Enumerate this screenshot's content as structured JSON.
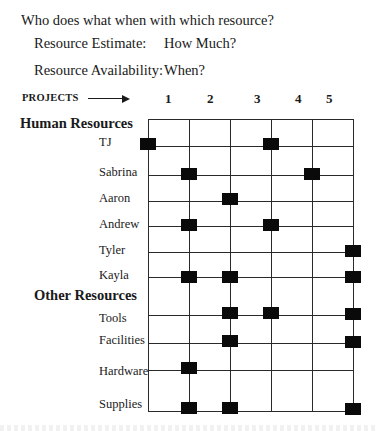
{
  "title": "Who does what when with which resource?",
  "questions": [
    {
      "label": "Resource Estimate:",
      "value": "How Much?"
    },
    {
      "label": "Resource Availability:",
      "value": "When?"
    }
  ],
  "projects": {
    "label": "PROJECTS",
    "arrow_icon": "right-arrow-icon",
    "numbers": [
      "1",
      "2",
      "3",
      "4",
      "5"
    ]
  },
  "sections": [
    {
      "heading": "Human Resources"
    },
    {
      "heading": "Other Resources"
    }
  ],
  "grid": {
    "column_lines_x": [
      148,
      189,
      230,
      271,
      312,
      353
    ],
    "top_y": 119,
    "bottom_y": 411,
    "line_color": "#2a2a2a",
    "marker_color": "#0a0a0a"
  },
  "rows": [
    {
      "label": "TJ",
      "section": "Human Resources",
      "marks_at_line": [
        1,
        4
      ]
    },
    {
      "label": "Sabrina",
      "section": "Human Resources",
      "marks_at_line": [
        2,
        5
      ]
    },
    {
      "label": "Aaron",
      "section": "Human Resources",
      "marks_at_line": [
        3
      ]
    },
    {
      "label": "Andrew",
      "section": "Human Resources",
      "marks_at_line": [
        2,
        4
      ]
    },
    {
      "label": "Tyler",
      "section": "Human Resources",
      "marks_at_line": [
        6
      ]
    },
    {
      "label": "Kayla",
      "section": "Human Resources",
      "marks_at_line": [
        2,
        3,
        6
      ]
    },
    {
      "label": "Tools",
      "section": "Other Resources",
      "marks_at_line": [
        3,
        4,
        6
      ]
    },
    {
      "label": "Facilities",
      "section": "Other Resources",
      "marks_at_line": [
        3,
        6
      ]
    },
    {
      "label": "Hardware",
      "section": "Other Resources",
      "marks_at_line": [
        2
      ]
    },
    {
      "label": "Supplies",
      "section": "Other Resources",
      "marks_at_line": [
        2,
        3,
        6
      ]
    }
  ]
}
